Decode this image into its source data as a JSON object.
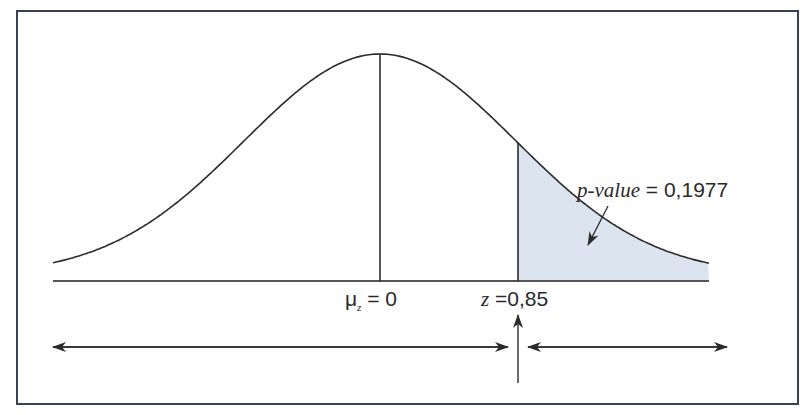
{
  "diagram": {
    "type": "normal-distribution-right-tail",
    "mean_label": {
      "symbol": "μ",
      "subscript": "z",
      "equals": "=",
      "value": "0"
    },
    "test_stat_label": {
      "symbol": "z",
      "equals": "=",
      "value": "0,85"
    },
    "pvalue_label": {
      "name": "p-value",
      "equals": "=",
      "value": "0,1977"
    },
    "colors": {
      "shade": "#dbe4ef",
      "line": "#2b2b2b",
      "frame": "#3a3f55"
    }
  }
}
